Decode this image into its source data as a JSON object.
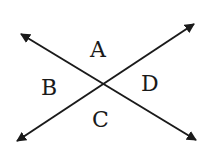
{
  "diagram": {
    "type": "intersecting-lines",
    "lines": [
      {
        "name": "line-1",
        "from": [
          21,
          34
        ],
        "to": [
          196,
          140
        ]
      },
      {
        "name": "line-2",
        "from": [
          17,
          141
        ],
        "to": [
          194,
          24
        ]
      }
    ],
    "intersection": [
      103,
      84
    ],
    "angles": [
      {
        "label": "A",
        "position": "top",
        "x": 98,
        "y": 57
      },
      {
        "label": "B",
        "position": "left",
        "x": 50,
        "y": 95
      },
      {
        "label": "C",
        "position": "bottom",
        "x": 100,
        "y": 127
      },
      {
        "label": "D",
        "position": "right",
        "x": 150,
        "y": 91
      }
    ],
    "stroke_color": "#1a1a1a",
    "background": "#ffffff"
  }
}
